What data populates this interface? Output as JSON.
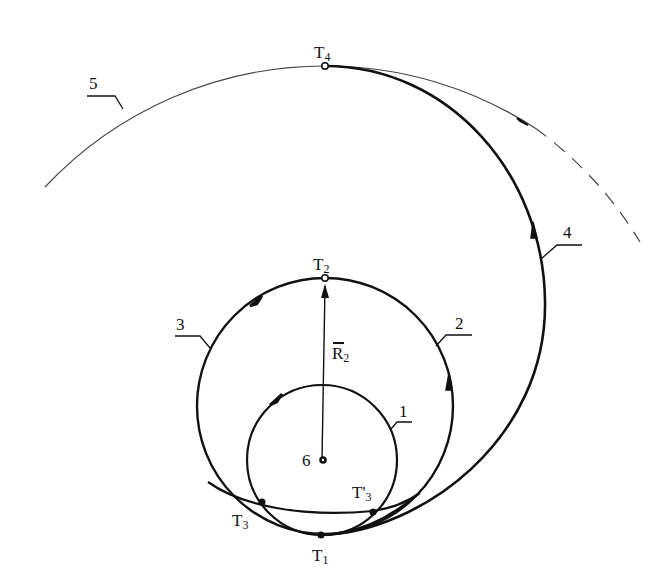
{
  "figure": {
    "cropped_header_text": "",
    "colors": {
      "line": "#111111",
      "background": "#ffffff",
      "thin_orbit": "#444444"
    }
  },
  "points": {
    "T4": {
      "label": "T",
      "sub": "4",
      "x": 325,
      "y": 66,
      "marker": "open-circle"
    },
    "T2": {
      "label": "T",
      "sub": "2",
      "x": 325,
      "y": 278,
      "marker": "open-circle"
    },
    "T1": {
      "label": "T",
      "sub": "1",
      "x": 321,
      "y": 535,
      "marker": "filled-dot"
    },
    "T3_left": {
      "label": "T",
      "sub": "3",
      "x": 260,
      "y": 502,
      "marker": "filled-dot"
    },
    "T3_right": {
      "label": "T'",
      "sub": "3",
      "x": 373,
      "y": 511,
      "marker": "filled-dot"
    },
    "center6": {
      "label": "6",
      "x": 322,
      "y": 460,
      "marker": "filled-dot"
    }
  },
  "vector": {
    "label": "R",
    "sub": "2",
    "overbar": true
  },
  "orbit_labels": {
    "o1": "1",
    "o2": "2",
    "o3": "3",
    "o4": "4",
    "o5": "5"
  }
}
